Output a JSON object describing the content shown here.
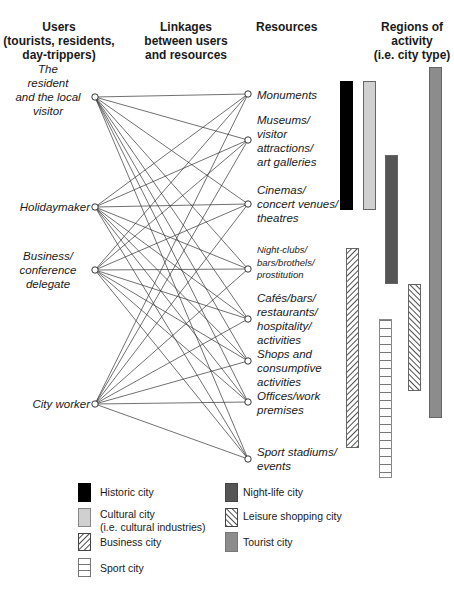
{
  "headers": {
    "users": [
      "Users",
      "(tourists, residents,",
      "day-trippers)"
    ],
    "linkages": [
      "Linkages",
      "between users",
      "and resources"
    ],
    "resources": [
      "Resources"
    ],
    "regions": [
      "Regions of",
      "activity",
      "(i.e. city type)"
    ]
  },
  "users": [
    {
      "id": "resident",
      "lines": [
        "The",
        "resident",
        "and the local",
        "visitor"
      ],
      "node_y": 97
    },
    {
      "id": "holidaymaker",
      "lines": [
        "Holidaymaker"
      ],
      "node_y": 207
    },
    {
      "id": "business",
      "lines": [
        "Business/",
        "conference",
        "delegate"
      ],
      "node_y": 270
    },
    {
      "id": "city-worker",
      "lines": [
        "City worker"
      ],
      "node_y": 404
    }
  ],
  "resources": [
    {
      "id": "monuments",
      "lines": [
        "Monuments"
      ],
      "node_y": 94
    },
    {
      "id": "museums",
      "lines": [
        "Museums/",
        "visitor",
        "attractions/",
        "art galleries"
      ],
      "node_y": 140
    },
    {
      "id": "cinemas",
      "lines": [
        "Cinemas/",
        "concert venues/",
        "theatres"
      ],
      "node_y": 204
    },
    {
      "id": "nightclubs",
      "lines": [
        "Night-clubs/",
        "bars/brothels/",
        "prostitution"
      ],
      "node_y": 269
    },
    {
      "id": "cafes",
      "lines": [
        "Cafés/bars/",
        "restaurants/",
        "hospitality/",
        "activities"
      ],
      "node_y": 319
    },
    {
      "id": "shops",
      "lines": [
        "Shops and",
        "consumptive",
        "activities"
      ],
      "node_y": 361
    },
    {
      "id": "offices",
      "lines": [
        "Offices/work",
        "premises"
      ],
      "node_y": 402
    },
    {
      "id": "sport",
      "lines": [
        "Sport stadiums/",
        "events"
      ],
      "node_y": 459
    }
  ],
  "regions": [
    {
      "id": "historic",
      "label": "Historic city",
      "x": 340,
      "y1": 81,
      "y2": 209,
      "fill": "#000000"
    },
    {
      "id": "cultural",
      "label": "Cultural city (i.e. cultural industries)",
      "x": 363,
      "y1": 81,
      "y2": 209,
      "fill": "#d0d0d0"
    },
    {
      "id": "nightlife",
      "label": "Night-life city",
      "x": 385,
      "y1": 155,
      "y2": 283,
      "fill": "#555555"
    },
    {
      "id": "tourist",
      "label": "Tourist city",
      "x": 429,
      "y1": 67,
      "y2": 417,
      "fill": "#8c8c8c"
    },
    {
      "id": "business",
      "label": "Business city",
      "x": 346,
      "y1": 248,
      "y2": 447,
      "fill": "hatch-fwd"
    },
    {
      "id": "leisure",
      "label": "Leisure shopping city",
      "x": 408,
      "y1": 284,
      "y2": 390,
      "fill": "hatch-back"
    },
    {
      "id": "sportcity",
      "label": "Sport city",
      "x": 379,
      "y1": 319,
      "y2": 477,
      "fill": "ladder"
    }
  ],
  "legend": {
    "left": [
      {
        "id": "historic",
        "lines": [
          "Historic city"
        ]
      },
      {
        "id": "cultural",
        "lines": [
          "Cultural city",
          "(i.e. cultural industries)"
        ]
      },
      {
        "id": "business",
        "lines": [
          "Business city"
        ]
      },
      {
        "id": "sportcity",
        "lines": [
          "Sport city"
        ]
      }
    ],
    "right": [
      {
        "id": "nightlife",
        "lines": [
          "Night-life city"
        ]
      },
      {
        "id": "leisure",
        "lines": [
          "Leisure shopping city"
        ]
      },
      {
        "id": "tourist",
        "lines": [
          "Tourist city"
        ]
      }
    ]
  },
  "colors": {
    "historic": "#000000",
    "cultural": "#d0d0d0",
    "nightlife": "#555555",
    "tourist": "#8c8c8c",
    "line": "#333333"
  }
}
